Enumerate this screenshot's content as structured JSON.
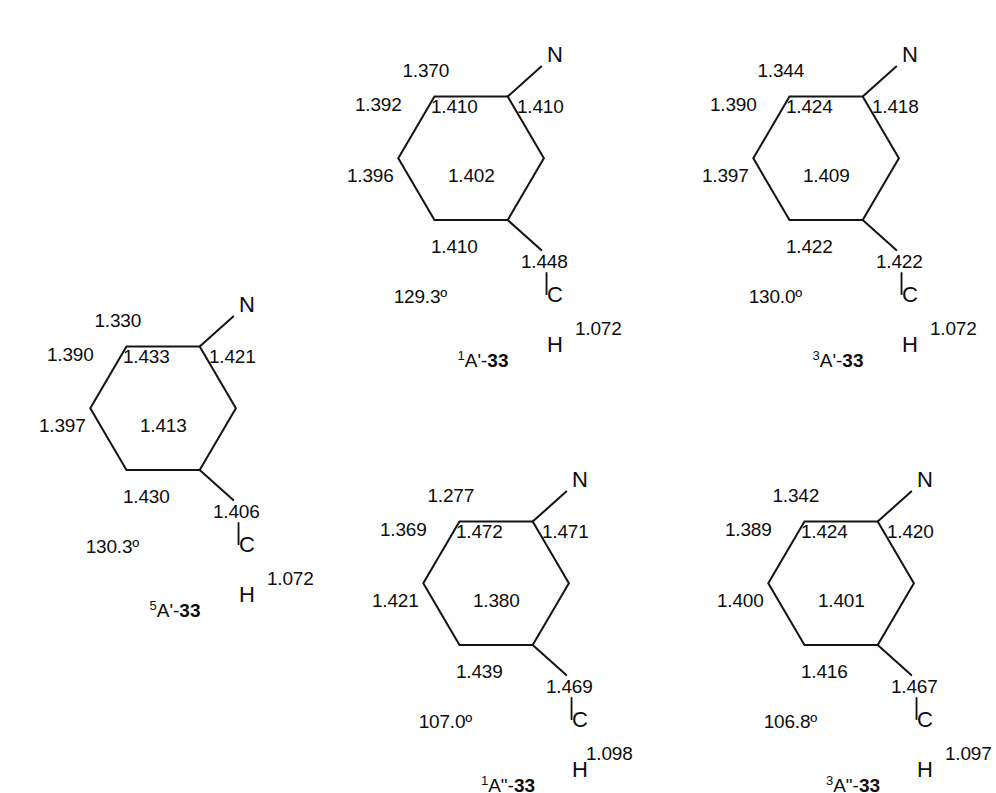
{
  "figure": {
    "background": "#ffffff",
    "ink": "#0d0d0d",
    "atoms": {
      "nitrogen": "N",
      "carbon": "C",
      "hydrogen": "H"
    }
  },
  "molecules": [
    {
      "id": "5A-prime-33",
      "label": {
        "multiplicity": "5",
        "term": "A'",
        "dash": "-",
        "number": "33"
      },
      "values": {
        "c_n": "1.330",
        "ring_top_left": "1.390",
        "ring_top_inner": "1.433",
        "ring_right_upper": "1.421",
        "ring_left_lower": "1.397",
        "ring_center": "1.413",
        "ring_bottom_inner": "1.430",
        "c_exo": "1.406",
        "angle": "130.3º",
        "c_h": "1.072"
      }
    },
    {
      "id": "1A-prime-33",
      "label": {
        "multiplicity": "1",
        "term": "A'",
        "dash": "-",
        "number": "33"
      },
      "values": {
        "c_n": "1.370",
        "ring_top_left": "1.392",
        "ring_top_inner": "1.410",
        "ring_right_upper": "1.410",
        "ring_left_lower": "1.396",
        "ring_center": "1.402",
        "ring_bottom_inner": "1.410",
        "c_exo": "1.448",
        "angle": "129.3º",
        "c_h": "1.072"
      }
    },
    {
      "id": "3A-prime-33",
      "label": {
        "multiplicity": "3",
        "term": "A'",
        "dash": "-",
        "number": "33"
      },
      "values": {
        "c_n": "1.344",
        "ring_top_left": "1.390",
        "ring_top_inner": "1.424",
        "ring_right_upper": "1.418",
        "ring_left_lower": "1.397",
        "ring_center": "1.409",
        "ring_bottom_inner": "1.422",
        "c_exo": "1.422",
        "angle": "130.0º",
        "c_h": "1.072"
      }
    },
    {
      "id": "1A-dprime-33",
      "label": {
        "multiplicity": "1",
        "term": "A\"",
        "dash": "-",
        "number": "33"
      },
      "values": {
        "c_n": "1.277",
        "ring_top_left": "1.369",
        "ring_top_inner": "1.472",
        "ring_right_upper": "1.471",
        "ring_left_lower": "1.421",
        "ring_center": "1.380",
        "ring_bottom_inner": "1.439",
        "c_exo": "1.469",
        "angle": "107.0º",
        "c_h": "1.098"
      }
    },
    {
      "id": "3A-dprime-33",
      "label": {
        "multiplicity": "3",
        "term": "A\"",
        "dash": "-",
        "number": "33"
      },
      "values": {
        "c_n": "1.342",
        "ring_top_left": "1.389",
        "ring_top_inner": "1.424",
        "ring_right_upper": "1.420",
        "ring_left_lower": "1.400",
        "ring_center": "1.401",
        "ring_bottom_inner": "1.416",
        "c_exo": "1.467",
        "angle": "106.8º",
        "c_h": "1.097"
      }
    }
  ]
}
